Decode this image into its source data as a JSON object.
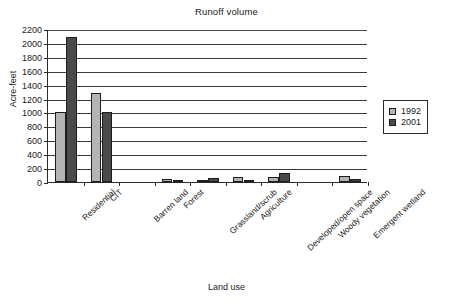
{
  "chart_data": {
    "type": "bar",
    "title": "Runoff volume",
    "xlabel": "Land use",
    "ylabel": "Acre-feet",
    "categories": [
      "Residential",
      "CIT",
      "Barren land",
      "Forest",
      "Grassland/scrub",
      "Agriculture",
      "Developed/open space",
      "Woody vegetation",
      "Emergent wetland"
    ],
    "series": [
      {
        "name": "1992",
        "color": "#b4b4b4",
        "values": [
          1000,
          1280,
          0,
          50,
          10,
          75,
          75,
          0,
          90
        ]
      },
      {
        "name": "2001",
        "color": "#4a4a4a",
        "values": [
          2090,
          1010,
          0,
          30,
          60,
          30,
          130,
          0,
          50
        ]
      }
    ],
    "ylim": [
      0,
      2200
    ],
    "ytick_step": 200,
    "yticks": [
      0,
      200,
      400,
      600,
      800,
      1000,
      1200,
      1400,
      1600,
      1800,
      2000,
      2200
    ],
    "ytick_labels": [
      "0",
      "200",
      "400",
      "600",
      "800",
      "1000",
      "1200",
      "1400",
      "1600",
      "1800",
      "2000",
      "2200"
    ],
    "grid": true,
    "grid_axis": "y",
    "legend_position": "right"
  },
  "legend": {
    "entries": [
      {
        "label": "1992",
        "swatch": "light-gray-swatch"
      },
      {
        "label": "2001",
        "swatch": "dark-gray-swatch"
      }
    ]
  }
}
